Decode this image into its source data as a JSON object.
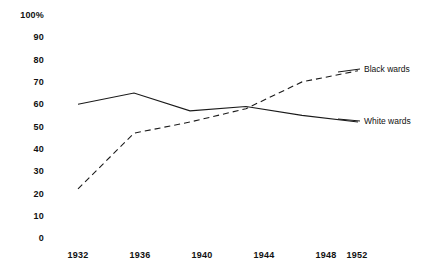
{
  "chart_data": {
    "type": "line",
    "title": "",
    "subtitle": "",
    "xlabel": "",
    "ylabel": "",
    "categories": [
      1932,
      1936,
      1940,
      1944,
      1948,
      1952
    ],
    "x_tick_labels": [
      "1932",
      "1936",
      "1940",
      "1944",
      "1948",
      "1952"
    ],
    "y_tick_labels": [
      "100%",
      "90",
      "80",
      "70",
      "60",
      "50",
      "40",
      "30",
      "20",
      "10",
      "0"
    ],
    "y_tick_values": [
      100,
      90,
      80,
      70,
      60,
      50,
      40,
      30,
      20,
      10,
      0
    ],
    "ylim": [
      0,
      100
    ],
    "xlim": [
      1932,
      1952
    ],
    "grid": false,
    "legend_position": "right-inline-labels",
    "series": [
      {
        "name": "Black wards",
        "style": "dashed",
        "color": "#1a1a1a",
        "values": [
          22,
          47,
          52,
          58,
          70,
          75
        ]
      },
      {
        "name": "White wards",
        "style": "solid",
        "color": "#1a1a1a",
        "values": [
          60,
          65,
          57,
          59,
          55,
          52
        ]
      }
    ]
  },
  "labels": {
    "black_wards": "Black wards",
    "white_wards": "White wards"
  }
}
